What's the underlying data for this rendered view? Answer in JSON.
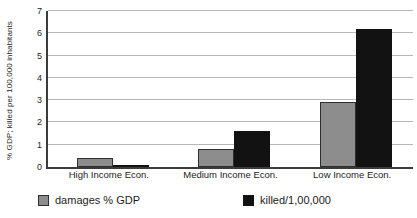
{
  "chart_data": {
    "type": "bar",
    "title": "",
    "subtitle": "",
    "xlabel": "",
    "ylabel": "% GDP; killed per 100,000 inhabitants",
    "categories": [
      "High Income Econ.",
      "Medium Income Econ.",
      "Low Income Econ."
    ],
    "series": [
      {
        "name": "damages % GDP",
        "color": "#8d8d8d",
        "values": [
          0.4,
          0.8,
          2.9
        ]
      },
      {
        "name": "killed/1,00,000",
        "color": "#121212",
        "values": [
          0.1,
          1.6,
          6.2
        ]
      }
    ],
    "ylim": [
      0,
      7
    ],
    "yticks": [
      0,
      1,
      2,
      3,
      4,
      5,
      6,
      7
    ],
    "ytick_labels": [
      "0",
      "1",
      "2",
      "3",
      "4",
      "5",
      "6",
      "7"
    ],
    "grid": true,
    "grid_axis": "y",
    "legend_position": "bottom",
    "legend": [
      "damages % GDP",
      "killed/1,00,000"
    ]
  },
  "axis": {
    "y_title": "% GDP; killed per 100,000 inhabitants"
  },
  "legend_items": [
    {
      "label": "damages % GDP"
    },
    {
      "label": "killed/1,00,000"
    }
  ]
}
